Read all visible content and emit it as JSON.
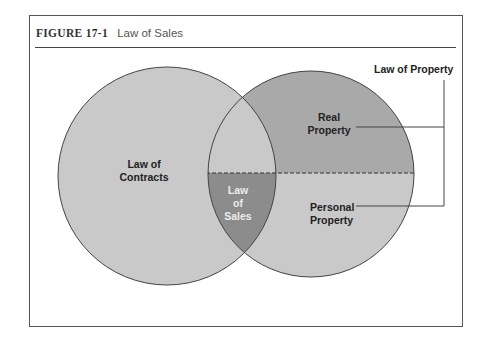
{
  "figure": {
    "number": "FIGURE 17-1",
    "title": "Law of Sales"
  },
  "diagram": {
    "type": "venn",
    "circles": [
      {
        "id": "contracts",
        "label": "Law of Contracts",
        "line1": "Law of",
        "line2": "Contracts"
      },
      {
        "id": "property",
        "label": "Law of Property",
        "regions": [
          "Real Property",
          "Personal Property"
        ]
      }
    ],
    "labels": {
      "law_of_property": "Law of Property",
      "real_line1": "Real",
      "real_line2": "Property",
      "personal_line1": "Personal",
      "personal_line2": "Property",
      "sales_line1": "Law",
      "sales_line2": "of",
      "sales_line3": "Sales"
    },
    "intersection": "Law of Sales",
    "colors": {
      "light_fill": "#c9c9c9",
      "real_property_fill": "#a9a9a9",
      "sales_fill": "#8c8c8c",
      "outline": "#444444"
    }
  }
}
